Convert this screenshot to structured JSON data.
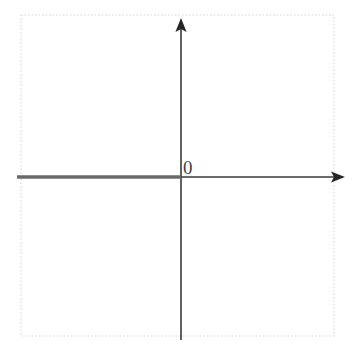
{
  "figure": {
    "width": 354,
    "height": 354,
    "background_color": "#ffffff"
  },
  "frame": {
    "name": "plot-border",
    "style": "dotted",
    "color": "#d8d8d8",
    "x": 21,
    "y": 15,
    "width": 313,
    "height": 321
  },
  "axes": {
    "origin": {
      "x": 181,
      "y": 177
    },
    "color": "#3a3a3a",
    "stroke_width": 1.6,
    "x_axis": {
      "name": "x-axis",
      "start_x": 17,
      "end_x": 345,
      "y": 177,
      "arrow": "right",
      "arrow_tip_x": 345
    },
    "y_axis": {
      "name": "y-axis",
      "x": 181,
      "start_y": 340,
      "end_y": 18,
      "arrow": "up",
      "arrow_tip_y": 18
    }
  },
  "highlight": {
    "name": "negative-x-ray",
    "description": "Thick gray ray along the negative x-axis from the left border to the origin",
    "color": "#6a6a6a",
    "stroke_width": 3.4,
    "from_x": 17,
    "to_x": 181,
    "y": 177,
    "direction": "leftward",
    "closed_endpoint_at_origin": true
  },
  "labels": {
    "origin_label": {
      "name": "origin-label",
      "text": "0",
      "x": 183,
      "y": 174,
      "font_size": 19,
      "color": "#454545"
    }
  },
  "chart_data": {
    "type": "line",
    "xlabel": "",
    "ylabel": "",
    "annotations": [
      {
        "text": "0",
        "x": 0,
        "y": 0,
        "position": "above-right-of-origin"
      }
    ],
    "series": [
      {
        "name": "negative-x-ray",
        "color": "#6a6a6a",
        "points": [
          {
            "x": "-infinity",
            "y": 0
          },
          {
            "x": 0,
            "y": 0
          }
        ]
      }
    ],
    "grid": false,
    "legend": "none"
  }
}
